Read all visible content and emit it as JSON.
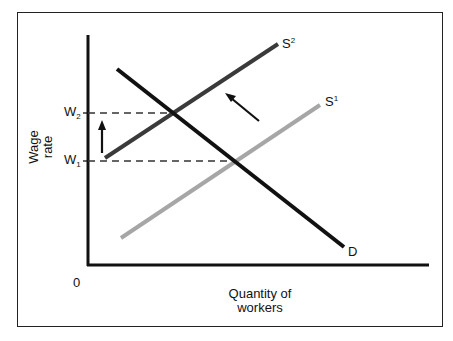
{
  "diagram": {
    "title": "",
    "y_axis_label_line1": "Wage",
    "y_axis_label_line2": "rate",
    "x_axis_label_line1": "Quantity of",
    "x_axis_label_line2": "workers",
    "origin_label": "0",
    "wage_levels": [
      {
        "label": "W",
        "subscript": "2",
        "description": "higher wage after supply decrease"
      },
      {
        "label": "W",
        "subscript": "1",
        "description": "initial equilibrium wage"
      }
    ],
    "curves": [
      {
        "id": "D",
        "label": "D",
        "kind": "demand",
        "color": "#111111"
      },
      {
        "id": "S1",
        "label": "S",
        "superscript": "1",
        "kind": "supply-original",
        "color": "#a6a6a6"
      },
      {
        "id": "S2",
        "label": "S",
        "superscript": "2",
        "kind": "supply-shifted",
        "color": "#3a3a3a"
      }
    ],
    "annotations": [
      {
        "type": "arrow",
        "meaning": "wage rises from W1 to W2"
      },
      {
        "type": "arrow",
        "meaning": "supply curve shifts left from S1 to S2"
      }
    ],
    "colors": {
      "axis": "#111111",
      "demand": "#111111",
      "supply_original": "#a6a6a6",
      "supply_shifted": "#3a3a3a",
      "guide_dashed": "#333333"
    }
  }
}
